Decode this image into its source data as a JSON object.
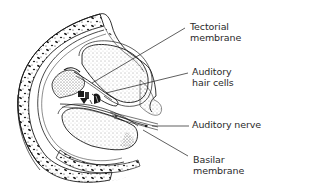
{
  "diagram": {
    "labels": [
      {
        "id": "tectorial",
        "text": "Tectorial\nmembrane"
      },
      {
        "id": "hair",
        "text": "Auditory\nhair cells"
      },
      {
        "id": "nerve",
        "text": "Auditory nerve"
      },
      {
        "id": "basilar",
        "text": "Basilar\nmembrane"
      }
    ],
    "colors": {
      "ink": "#1a1a1a",
      "stipple": "#555555",
      "background": "#ffffff"
    }
  }
}
